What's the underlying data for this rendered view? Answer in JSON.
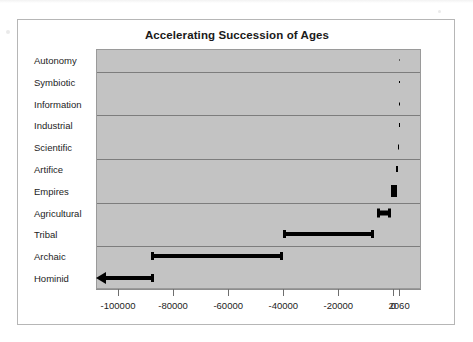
{
  "chart_data": {
    "type": "bar",
    "title": "Accelerating Succession of Ages",
    "xlabel": "",
    "ylabel": "",
    "orientation": "horizontal",
    "grid": true,
    "legend": null,
    "xlim": [
      -108000,
      10000
    ],
    "xticks": [
      -100000,
      -80000,
      -60000,
      -40000,
      -20000,
      0,
      2060
    ],
    "xticklabels": [
      "-100000",
      "-80000",
      "-60000",
      "-40000",
      "-20000",
      "0",
      "2060"
    ],
    "categories": [
      "Autonomy",
      "Symbiotic",
      "Information",
      "Industrial",
      "Scientific",
      "Artifice",
      "Empires",
      "Agricultural",
      "Tribal",
      "Archaic",
      "Hominid"
    ],
    "note": "Each bar is a horizontal range (start year to end year) shown with I-beam end caps; the Hominid range extends off the left of the axis and is drawn with an arrowhead.",
    "ranges": [
      {
        "category": "Autonomy",
        "start": 2055,
        "end": 2060,
        "open_left": false,
        "thickness": 1
      },
      {
        "category": "Symbiotic",
        "start": 2040,
        "end": 2058,
        "open_left": false,
        "thickness": 2
      },
      {
        "category": "Information",
        "start": 1990,
        "end": 2050,
        "open_left": false,
        "thickness": 3
      },
      {
        "category": "Industrial",
        "start": 1850,
        "end": 2000,
        "open_left": false,
        "thickness": 4
      },
      {
        "category": "Scientific",
        "start": 1600,
        "end": 1900,
        "open_left": false,
        "thickness": 5
      },
      {
        "category": "Artifice",
        "start": 1000,
        "end": 1700,
        "open_left": false,
        "thickness": 6
      },
      {
        "category": "Empires",
        "start": -1000,
        "end": 1200,
        "open_left": false,
        "thickness": 8
      },
      {
        "category": "Agricultural",
        "start": -6000,
        "end": -1000,
        "open_left": false,
        "thickness": 5
      },
      {
        "category": "Tribal",
        "start": -40000,
        "end": -7000,
        "open_left": false,
        "thickness": 4
      },
      {
        "category": "Archaic",
        "start": -88000,
        "end": -40000,
        "open_left": false,
        "thickness": 4
      },
      {
        "category": "Hominid",
        "start": -108000,
        "end": -87000,
        "open_left": true,
        "thickness": 4
      }
    ],
    "colors": {
      "bar": "#000000",
      "plot_background": "#c3c3c3",
      "gridline": "#7d7d7d",
      "frame": "#b6b6b6",
      "text": "#1d1d1d"
    }
  }
}
